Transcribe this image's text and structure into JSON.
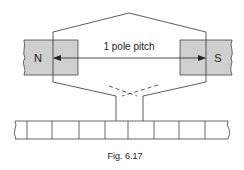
{
  "diagram": {
    "poles": {
      "north": {
        "label": "N",
        "fill": "#cfcfcf"
      },
      "south": {
        "label": "S",
        "fill": "#cfcfcf"
      }
    },
    "dimension": {
      "label": "1 pole pitch"
    },
    "coil": {
      "stroke": "#333333"
    },
    "commutator": {
      "segments": 9
    },
    "caption": "Fig. 6.17"
  }
}
